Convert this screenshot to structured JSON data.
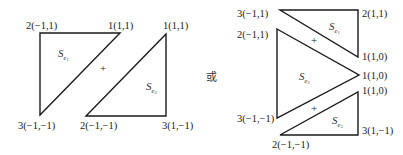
{
  "left_figure": {
    "triangle_e1": {
      "label": "S",
      "sub": "e",
      "sub2": "1",
      "vertices": [
        {
          "text": "2(−1,1)"
        },
        {
          "text": "1(1,1)"
        },
        {
          "text": "3(−1,−1)"
        }
      ]
    },
    "triangle_e2": {
      "label": "S",
      "sub": "e",
      "sub2": "2",
      "vertices": [
        {
          "text": "1(1,1)"
        },
        {
          "text": "2(−1,−1)"
        },
        {
          "text": "3(1,−1)"
        }
      ]
    },
    "plus": "+"
  },
  "separator": "或",
  "right_figure": {
    "triangle_e1": {
      "label": "S",
      "sub": "e",
      "sub2": "1",
      "vertices": [
        {
          "text": "3(−1,1)"
        },
        {
          "text": "2(1,1)"
        },
        {
          "text": "1(1,0)"
        }
      ]
    },
    "triangle_e2": {
      "label": "S",
      "sub": "e",
      "sub2": "2",
      "vertices": [
        {
          "text": "2(−1,1)"
        },
        {
          "text": "1(1,0)"
        },
        {
          "text": "3(−1,−1)"
        }
      ]
    },
    "triangle_e3": {
      "label": "S",
      "sub": "e",
      "sub2": "3",
      "vertices": [
        {
          "text": "1(1,0)"
        },
        {
          "text": "3(1,−1)"
        },
        {
          "text": "2(−1,−1)"
        }
      ]
    },
    "plus_top": "+",
    "plus_bottom": "+"
  }
}
